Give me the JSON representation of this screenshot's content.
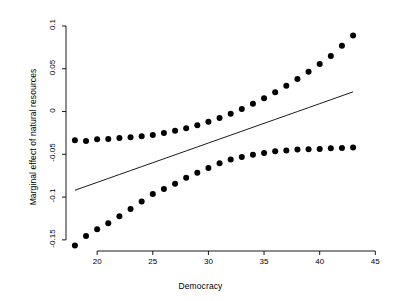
{
  "figure": {
    "background_color": "#ffffff",
    "foreground_color": "#000000"
  },
  "chart_data": {
    "type": "line",
    "title": "",
    "subtitle": "",
    "xlabel": "Democracy",
    "ylabel": "Marginal effect of natural resources",
    "xlim": [
      17.2,
      45.6
    ],
    "ylim": [
      -0.163,
      0.105
    ],
    "xticks": [
      20,
      25,
      30,
      35,
      40,
      45
    ],
    "xtick_labels": [
      "20",
      "25",
      "30",
      "35",
      "40",
      "45"
    ],
    "yticks": [
      0.1,
      0.05,
      0,
      -0.05,
      -0.1,
      -0.15
    ],
    "ytick_labels": [
      "0.1",
      "0.05",
      "0",
      "-0.05",
      "-0.1",
      "-0.15"
    ],
    "grid": false,
    "legend": null,
    "legend_position": "none",
    "annotations": [],
    "x": [
      18,
      19,
      20,
      21,
      22,
      23,
      24,
      25,
      26,
      27,
      28,
      29,
      30,
      31,
      32,
      33,
      34,
      35,
      36,
      37,
      38,
      39,
      40,
      41,
      42,
      43
    ],
    "series": [
      {
        "name": "Upper 95% confidence bound",
        "style": "dotted",
        "marker": "circle",
        "marker_size": 3.0,
        "color": "#000000",
        "values": [
          -0.0335,
          -0.0345,
          -0.0325,
          -0.032,
          -0.031,
          -0.03,
          -0.029,
          -0.0275,
          -0.025,
          -0.0225,
          -0.0195,
          -0.016,
          -0.012,
          -0.0075,
          -0.0025,
          0.003,
          0.009,
          0.0155,
          0.0225,
          0.03,
          0.038,
          0.0465,
          0.0555,
          0.065,
          0.077,
          0.089
        ]
      },
      {
        "name": "Marginal effect (point estimate)",
        "style": "solid-line",
        "marker": "none",
        "color": "#000000",
        "values": [
          -0.092,
          -0.0874,
          -0.0828,
          -0.0782,
          -0.0736,
          -0.069,
          -0.0644,
          -0.0598,
          -0.0552,
          -0.0506,
          -0.046,
          -0.0414,
          -0.0368,
          -0.0322,
          -0.0276,
          -0.023,
          -0.0184,
          -0.0138,
          -0.0092,
          -0.0046,
          0.0,
          0.0046,
          0.0092,
          0.0138,
          0.0184,
          0.023
        ]
      },
      {
        "name": "Lower 95% confidence bound",
        "style": "dotted",
        "marker": "circle",
        "marker_size": 3.0,
        "color": "#000000",
        "values": [
          -0.1565,
          -0.1455,
          -0.1375,
          -0.1305,
          -0.1225,
          -0.114,
          -0.105,
          -0.0965,
          -0.0905,
          -0.0845,
          -0.0775,
          -0.0715,
          -0.066,
          -0.0605,
          -0.056,
          -0.053,
          -0.0505,
          -0.0485,
          -0.0465,
          -0.0455,
          -0.0445,
          -0.0442,
          -0.0437,
          -0.043,
          -0.0425,
          -0.042
        ]
      }
    ]
  }
}
